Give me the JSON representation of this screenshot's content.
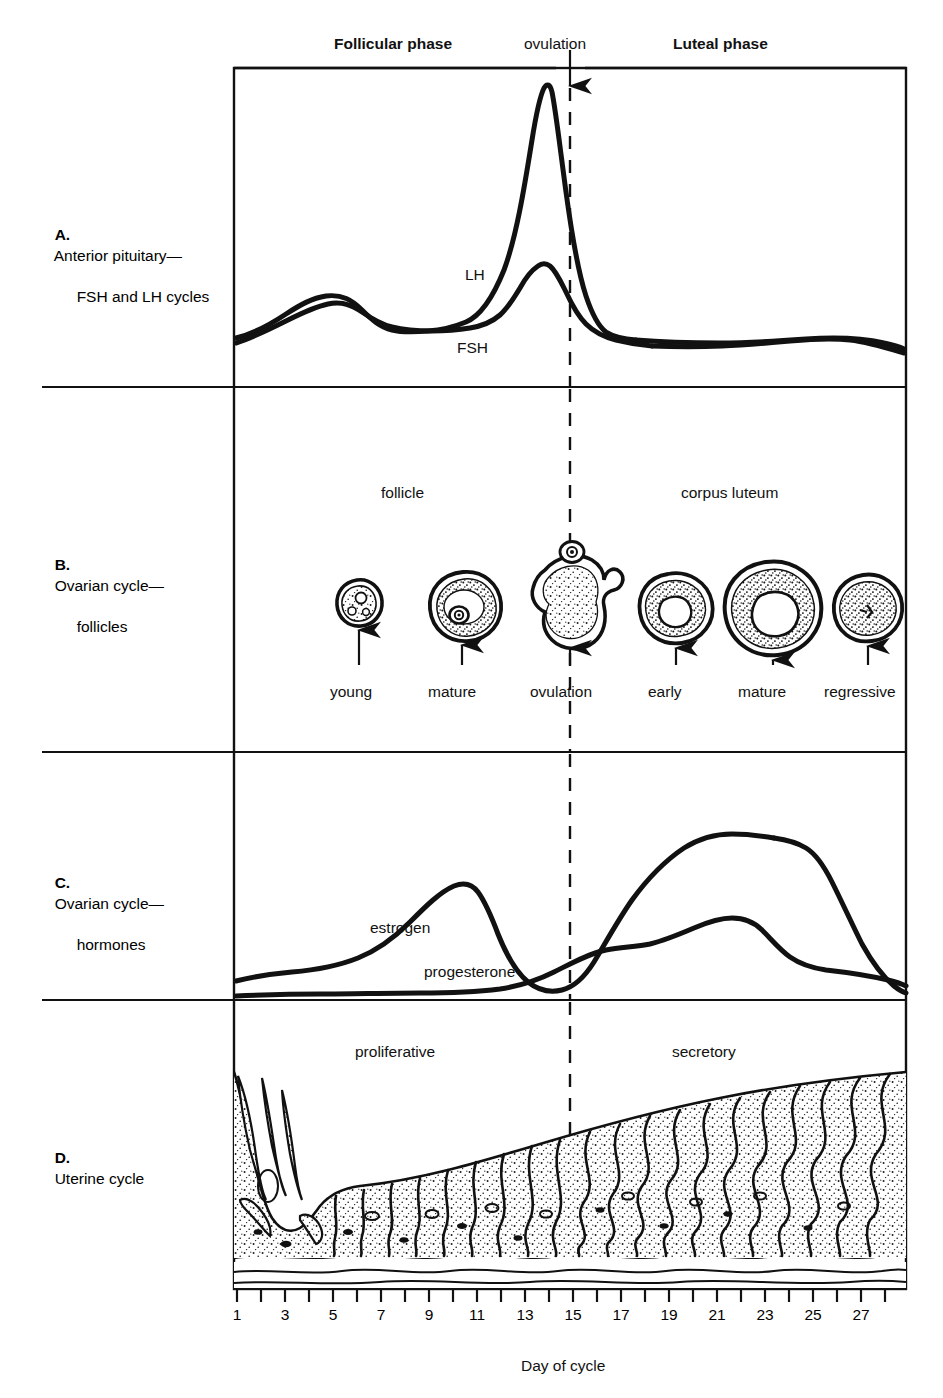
{
  "figure": {
    "title_top_labels": {
      "follicular_phase": "Follicular phase",
      "ovulation": "ovulation",
      "luteal_phase": "Luteal phase"
    },
    "x_axis_title": "Day of cycle",
    "ovulation_day": 14
  },
  "panels": [
    {
      "key": "A",
      "letter": "A.",
      "title_line1": "Anterior pituitary—",
      "title_line2": "FSH and LH cycles",
      "curve_labels": {
        "lh": "LH",
        "fsh": "FSH"
      }
    },
    {
      "key": "B",
      "letter": "B.",
      "title_line1": "Ovarian cycle—",
      "title_line2": "follicles",
      "group_labels": {
        "left": "follicle",
        "right": "corpus luteum"
      },
      "stages": [
        {
          "label": "young",
          "day": 5
        },
        {
          "label": "mature",
          "day": 9
        },
        {
          "label": "ovulation",
          "day": 14
        },
        {
          "label": "early",
          "day": 18
        },
        {
          "label": "mature",
          "day": 22
        },
        {
          "label": "regressive",
          "day": 26
        }
      ]
    },
    {
      "key": "C",
      "letter": "C.",
      "title_line1": "Ovarian cycle—",
      "title_line2": "hormones",
      "curve_labels": {
        "estrogen": "estrogen",
        "progesterone": "progesterone"
      }
    },
    {
      "key": "D",
      "letter": "D.",
      "title_line1": "Uterine cycle",
      "title_line2": "",
      "group_labels": {
        "left": "proliferative",
        "right": "secretory"
      }
    }
  ],
  "chart_data": {
    "type": "line",
    "xlabel": "Day of cycle",
    "ylabel": "",
    "xlim": [
      1,
      28
    ],
    "grid": false,
    "legend": "inline curve labels",
    "tick_labels": [
      "1",
      "3",
      "5",
      "7",
      "9",
      "11",
      "13",
      "15",
      "17",
      "19",
      "21",
      "23",
      "25",
      "27"
    ],
    "tick_days_all": [
      1,
      2,
      3,
      4,
      5,
      6,
      7,
      8,
      9,
      10,
      11,
      12,
      13,
      14,
      15,
      16,
      17,
      18,
      19,
      20,
      21,
      22,
      23,
      24,
      25,
      26,
      27,
      28
    ],
    "annotations": [
      {
        "text": "Follicular phase",
        "day_range": [
          1,
          14
        ]
      },
      {
        "text": "ovulation",
        "day": 14
      },
      {
        "text": "Luteal phase",
        "day_range": [
          14,
          28
        ]
      }
    ],
    "panels": [
      {
        "panel": "A",
        "name": "Anterior pituitary—FSH and LH cycles",
        "series": [
          {
            "name": "LH",
            "x": [
              1,
              2,
              3,
              4,
              5,
              6,
              7,
              8,
              9,
              10,
              11,
              12,
              13,
              14,
              15,
              16,
              17,
              18,
              19,
              20,
              21,
              22,
              23,
              24,
              25,
              26,
              27,
              28
            ],
            "values": [
              8,
              10,
              12,
              14,
              15,
              14,
              13,
              12,
              12,
              13,
              18,
              45,
              96,
              62,
              22,
              12,
              9,
              8,
              8,
              8,
              8,
              8,
              8,
              8,
              8,
              8,
              7,
              6
            ]
          },
          {
            "name": "FSH",
            "x": [
              1,
              2,
              3,
              4,
              5,
              6,
              7,
              8,
              9,
              10,
              11,
              12,
              13,
              14,
              15,
              16,
              17,
              18,
              19,
              20,
              21,
              22,
              23,
              24,
              25,
              26,
              27,
              28
            ],
            "values": [
              10,
              13,
              16,
              19,
              20,
              18,
              14,
              11,
              10,
              10,
              12,
              22,
              40,
              28,
              14,
              10,
              8,
              8,
              9,
              10,
              10,
              9,
              8,
              8,
              8,
              8,
              9,
              10
            ]
          }
        ]
      },
      {
        "panel": "C",
        "name": "Ovarian cycle—hormones",
        "series": [
          {
            "name": "estrogen",
            "x": [
              1,
              2,
              3,
              4,
              5,
              6,
              7,
              8,
              9,
              10,
              11,
              12,
              13,
              14,
              15,
              16,
              17,
              18,
              19,
              20,
              21,
              22,
              23,
              24,
              25,
              26,
              27,
              28
            ],
            "values": [
              6,
              6,
              6,
              7,
              8,
              10,
              14,
              20,
              28,
              38,
              50,
              58,
              52,
              38,
              24,
              18,
              22,
              32,
              44,
              52,
              55,
              56,
              56,
              50,
              36,
              20,
              10,
              5
            ]
          },
          {
            "name": "progesterone",
            "x": [
              1,
              2,
              3,
              4,
              5,
              6,
              7,
              8,
              9,
              10,
              11,
              12,
              13,
              14,
              15,
              16,
              17,
              18,
              19,
              20,
              21,
              22,
              23,
              24,
              25,
              26,
              27,
              28
            ],
            "values": [
              1,
              1,
              1,
              1,
              1,
              1,
              1,
              1,
              1,
              1,
              2,
              3,
              6,
              12,
              18,
              20,
              22,
              26,
              30,
              32,
              30,
              26,
              22,
              18,
              14,
              10,
              6,
              3
            ]
          }
        ]
      }
    ]
  }
}
